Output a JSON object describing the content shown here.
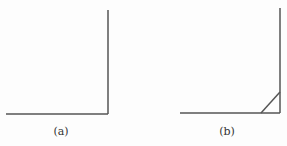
{
  "figure": {
    "panels": [
      {
        "id": "a",
        "label": "(a)",
        "description": "right-angle corner joint without brace"
      },
      {
        "id": "b",
        "label": "(b)",
        "description": "right-angle corner joint with diagonal brace"
      }
    ],
    "line_color": "#555555"
  }
}
